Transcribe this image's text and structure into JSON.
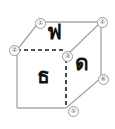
{
  "figure": {
    "name": "labeled-cube-diagram",
    "background_color": "#ffffff",
    "edge_color": "#a8a8a8",
    "hidden_edge_color": "#1a1a1a",
    "glyph_color": "#111111",
    "vertex_label_color": "#6d6d6d"
  },
  "faces": [
    {
      "id": "top",
      "glyph": "ฟ"
    },
    {
      "id": "front",
      "glyph": "ธ"
    },
    {
      "id": "right",
      "glyph": "ด"
    }
  ],
  "vertices": [
    {
      "id": 1,
      "label": "①",
      "x": 35,
      "y": 18
    },
    {
      "id": 2,
      "label": "②",
      "x": 9,
      "y": 45
    },
    {
      "id": 3,
      "label": "③",
      "x": 62,
      "y": 51
    },
    {
      "id": 4,
      "label": "④",
      "x": 97,
      "y": 17
    },
    {
      "id": 5,
      "label": "⑤",
      "x": 68,
      "y": 106
    },
    {
      "id": 6,
      "label": "⑥",
      "x": 98,
      "y": 74
    }
  ]
}
